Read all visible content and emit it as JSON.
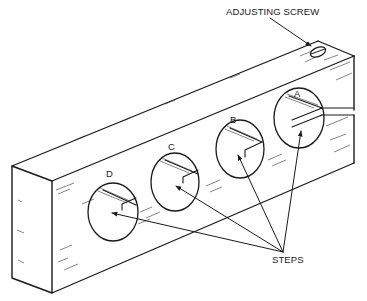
{
  "figure": {
    "labels": {
      "adjusting_screw": "ADJUSTING SCREW",
      "steps": "STEPS",
      "holes": [
        "A",
        "B",
        "C",
        "D"
      ]
    },
    "colors": {
      "line": "#1a1a1a",
      "background": "#ffffff"
    }
  }
}
